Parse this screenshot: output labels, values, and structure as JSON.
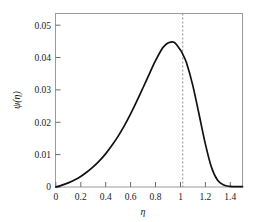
{
  "chart_data": {
    "type": "line",
    "title": "",
    "xlabel": "η",
    "ylabel": "ψ(η)",
    "xlim": [
      0,
      1.5
    ],
    "ylim": [
      0,
      0.0545
    ],
    "grid": false,
    "legend": null,
    "xticks": [
      0,
      0.2,
      0.4,
      0.6,
      0.8,
      1,
      1.2,
      1.4
    ],
    "xticklabels": [
      "0",
      "0.2",
      "0.4",
      "0.6",
      "0.8",
      "1",
      "1.2",
      "1.4"
    ],
    "yticks": [
      0,
      0.01,
      0.02,
      0.03,
      0.04,
      0.05
    ],
    "yticklabels": [
      "0",
      "0.01",
      "0.02",
      "0.03",
      "0.04",
      "0.05"
    ],
    "series": [
      {
        "name": "psi",
        "color": "#111111",
        "style": "solid",
        "x": [
          0.0,
          0.05,
          0.1,
          0.15,
          0.2,
          0.25,
          0.3,
          0.35,
          0.4,
          0.45,
          0.5,
          0.55,
          0.6,
          0.65,
          0.7,
          0.75,
          0.8,
          0.85,
          0.87,
          0.9,
          0.95,
          1.0,
          1.02,
          1.05,
          1.1,
          1.15,
          1.2,
          1.25,
          1.3,
          1.35,
          1.4,
          1.45,
          1.5
        ],
        "y": [
          0.0,
          0.0006,
          0.0013,
          0.0022,
          0.0033,
          0.0047,
          0.0063,
          0.0082,
          0.0104,
          0.013,
          0.0159,
          0.0192,
          0.0229,
          0.0269,
          0.0311,
          0.0354,
          0.0396,
          0.0432,
          0.0442,
          0.0452,
          0.0455,
          0.0431,
          0.0417,
          0.039,
          0.032,
          0.023,
          0.0138,
          0.0063,
          0.0021,
          0.0006,
          0.0002,
          0.0001,
          0.0001
        ]
      }
    ],
    "annotations": [
      {
        "type": "vline",
        "name": "critical-eta-marker",
        "x": 1.02,
        "style": "dashed",
        "color": "#8c8c8c",
        "label": ""
      }
    ]
  },
  "axes": {
    "y_axis_title": "ψ(η)",
    "x_axis_title": "η"
  }
}
